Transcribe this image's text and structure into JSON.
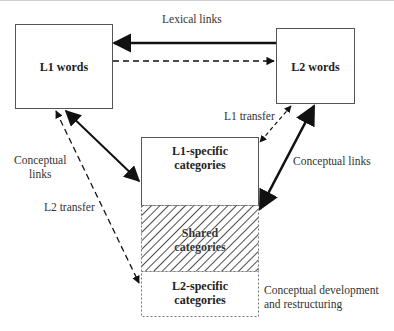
{
  "diagram": {
    "nodes": {
      "l1_words": "L1 words",
      "l2_words": "L2 words",
      "l1_specific": [
        "L1-specific",
        "categories"
      ],
      "shared": [
        "Shared",
        "categories"
      ],
      "l2_specific": [
        "L2-specific",
        "categories"
      ]
    },
    "edges": {
      "lexical_links": "Lexical links",
      "l1_transfer": "L1 transfer",
      "conceptual_links_left": [
        "Conceptual",
        "links"
      ],
      "conceptual_links_right": "Conceptual links",
      "l2_transfer": "L2 transfer",
      "conceptual_development": [
        "Conceptual development",
        "and restructuring"
      ]
    },
    "colors": {
      "line": "#111111",
      "box_border": "#555555",
      "hatch": "#222222"
    }
  }
}
